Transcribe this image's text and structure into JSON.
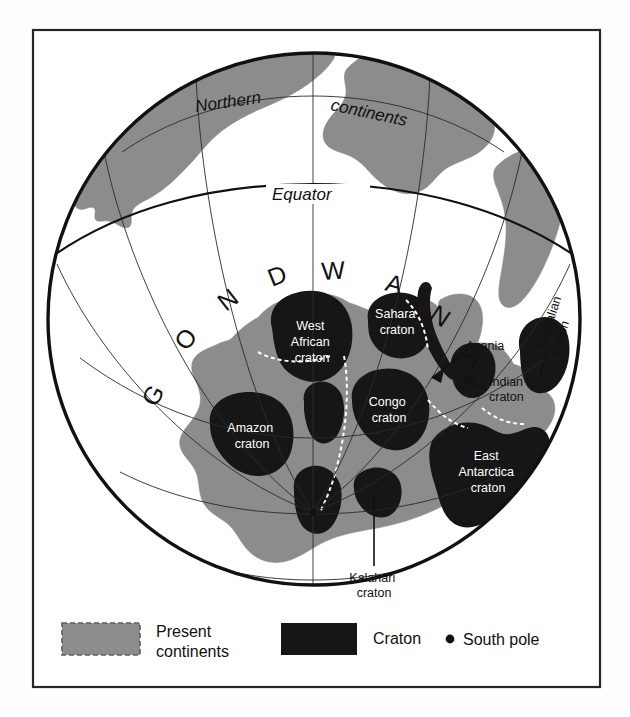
{
  "figure": {
    "title_label": "Northern continents",
    "equator_label": "Equator",
    "supercontinent_label": "GONDWANA",
    "supercontinent_letters": [
      "G",
      "O",
      "N",
      "D",
      "W",
      "A",
      "N",
      "A"
    ],
    "northern_word_1": "Northern",
    "northern_word_2": "continents"
  },
  "cratons": [
    {
      "id": "west-african",
      "lines": [
        "West",
        "African",
        "craton"
      ]
    },
    {
      "id": "sahara",
      "lines": [
        "Sahara",
        "craton"
      ]
    },
    {
      "id": "congo",
      "lines": [
        "Congo",
        "craton"
      ]
    },
    {
      "id": "amazon",
      "lines": [
        "Amazon",
        "craton"
      ]
    },
    {
      "id": "east-antarctica",
      "lines": [
        "East",
        "Antarctica",
        "craton"
      ]
    },
    {
      "id": "kalahari",
      "lines": [
        "Kalahari",
        "craton"
      ]
    },
    {
      "id": "indian",
      "lines": [
        "Indian",
        "craton"
      ]
    },
    {
      "id": "australian",
      "lines": [
        "Australian",
        "craton"
      ]
    },
    {
      "id": "azania",
      "lines": [
        "Azania"
      ]
    }
  ],
  "leader_labels": {
    "azania": "Azania",
    "indian_1": "Indian",
    "indian_2": "craton",
    "australian_1": "Australian",
    "australian_2": "craton",
    "kalahari_1": "Kalahari",
    "kalahari_2": "craton"
  },
  "legend": {
    "items": [
      {
        "id": "present-continents",
        "label_1": "Present",
        "label_2": "continents",
        "swatch": "gray-dashed",
        "color": "#8c8c8c"
      },
      {
        "id": "craton",
        "label_1": "Craton",
        "label_2": "",
        "swatch": "black-solid",
        "color": "#161616"
      },
      {
        "id": "south-pole",
        "label_1": "South pole",
        "label_2": "",
        "swatch": "black-dot",
        "color": "#111111"
      }
    ]
  },
  "colors": {
    "continent_gray": "#8c8c8c",
    "craton_black": "#161616",
    "line_black": "#111111",
    "background": "#fdfdfd",
    "frame": "#222222"
  }
}
